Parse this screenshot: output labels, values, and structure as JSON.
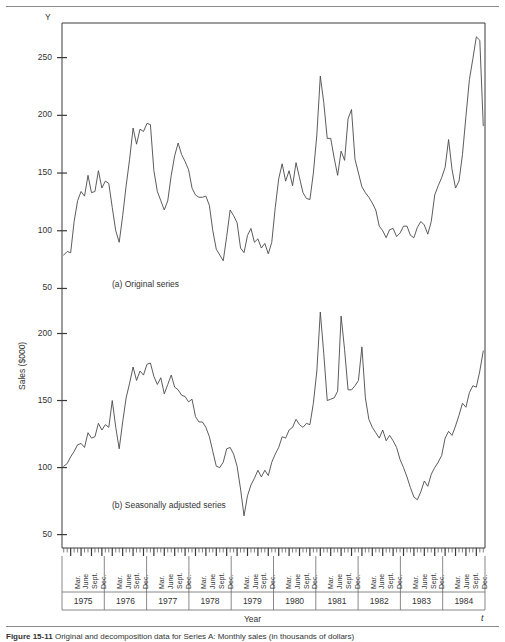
{
  "figure": {
    "caption_number": "Figure  15-11",
    "caption_text": "Original and decomposition data for Series A: Monthly sales (in thousands of dollars)",
    "y_axis_title": "Sales ($000)",
    "x_axis_title": "Year",
    "y_corner_symbol": "Y",
    "t_corner_symbol": "t"
  },
  "panels": [
    {
      "key": "a",
      "label": "(a)  Original series"
    },
    {
      "key": "b",
      "label": "(b)  Seasonally adjusted series"
    }
  ],
  "axis": {
    "top_ticks": [
      "250",
      "200",
      "150",
      "100",
      "50"
    ],
    "bottom_ticks": [
      "200",
      "150",
      "100",
      "50"
    ],
    "months": [
      "Mar.",
      "June",
      "Sept.",
      "Dec."
    ],
    "years": [
      "1975",
      "1976",
      "1977",
      "1978",
      "1979",
      "1980",
      "1981",
      "1982",
      "1983",
      "1984"
    ]
  },
  "chart_data": {
    "type": "line",
    "xlabel": "Year",
    "ylabel": "Sales ($000)",
    "grid": false,
    "legend": "none",
    "x_start": "1975-01",
    "x_end": "1984-12",
    "x_tick_labels": [
      "Mar.",
      "June",
      "Sept.",
      "Dec."
    ],
    "x_group_labels": [
      "1975",
      "1976",
      "1977",
      "1978",
      "1979",
      "1980",
      "1981",
      "1982",
      "1983",
      "1984"
    ],
    "panels": [
      {
        "name": "Original series",
        "panel": "a",
        "ylim": [
          40,
          280
        ],
        "yticks": [
          50,
          100,
          150,
          200,
          250
        ],
        "values": [
          79,
          82,
          81,
          108,
          126,
          134,
          130,
          148,
          133,
          134,
          152,
          137,
          143,
          141,
          120,
          100,
          90,
          113,
          139,
          162,
          189,
          175,
          188,
          186,
          193,
          192,
          152,
          134,
          126,
          118,
          126,
          148,
          165,
          176,
          166,
          160,
          153,
          137,
          131,
          129,
          129,
          130,
          122,
          100,
          84,
          79,
          74,
          95,
          118,
          113,
          107,
          85,
          81,
          96,
          102,
          90,
          93,
          85,
          89,
          80,
          90,
          120,
          145,
          158,
          143,
          152,
          139,
          159,
          146,
          133,
          128,
          127,
          150,
          183,
          234,
          211,
          180,
          180,
          163,
          148,
          169,
          161,
          197,
          205,
          162,
          150,
          138,
          133,
          129,
          124,
          118,
          104,
          100,
          94,
          101,
          102,
          95,
          98,
          104,
          104,
          96,
          94,
          103,
          108,
          105,
          97,
          108,
          131,
          139,
          146,
          155,
          179,
          153,
          137,
          143,
          166,
          199,
          231,
          249,
          268,
          265,
          191
        ]
      },
      {
        "name": "Seasonally adjusted series",
        "panel": "b",
        "ylim": [
          40,
          225
        ],
        "yticks": [
          50,
          100,
          150,
          200
        ],
        "values": [
          101,
          103,
          108,
          112,
          117,
          118,
          115,
          126,
          122,
          123,
          133,
          128,
          132,
          130,
          150,
          130,
          114,
          134,
          152,
          163,
          175,
          165,
          172,
          169,
          177,
          178,
          168,
          162,
          167,
          155,
          162,
          169,
          160,
          158,
          154,
          153,
          149,
          151,
          138,
          134,
          134,
          130,
          123,
          112,
          101,
          100,
          104,
          114,
          115,
          110,
          101,
          84,
          64,
          79,
          87,
          92,
          98,
          93,
          98,
          94,
          104,
          110,
          115,
          123,
          122,
          128,
          130,
          136,
          132,
          130,
          133,
          132,
          148,
          172,
          216,
          185,
          150,
          151,
          152,
          157,
          213,
          188,
          158,
          158,
          161,
          165,
          190,
          152,
          136,
          130,
          126,
          122,
          128,
          120,
          124,
          120,
          115,
          106,
          100,
          93,
          85,
          78,
          76,
          82,
          90,
          86,
          95,
          100,
          104,
          109,
          122,
          127,
          124,
          131,
          139,
          148,
          145,
          156,
          161,
          160,
          172,
          187
        ]
      }
    ]
  }
}
